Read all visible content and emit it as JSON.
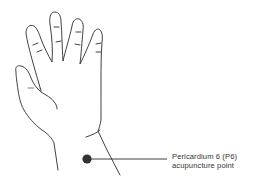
{
  "diagram": {
    "label": {
      "line1": "Pericardium 6 (P6)",
      "line2": "acupuncture point"
    },
    "marker": {
      "name": "P6 point",
      "color": "#333333"
    },
    "colors": {
      "outline": "#2b2b2b",
      "background": "#ffffff",
      "text": "#333333"
    }
  }
}
